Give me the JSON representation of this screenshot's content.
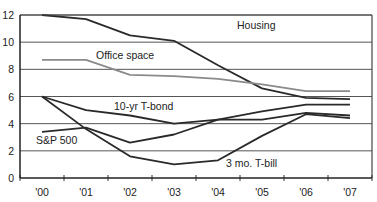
{
  "chart_data": {
    "type": "line",
    "title": "",
    "xlabel": "",
    "ylabel": "",
    "categories": [
      "'00",
      "'01",
      "'02",
      "'03",
      "'04",
      "'05",
      "'06",
      "'07"
    ],
    "ylim": [
      0,
      12
    ],
    "yticks": [
      0,
      2,
      4,
      6,
      8,
      10,
      12
    ],
    "grid": true,
    "legend": "inline labels",
    "series": [
      {
        "name": "Housing",
        "color": "#2a2a2a",
        "values": [
          12.0,
          11.7,
          10.5,
          10.1,
          8.3,
          6.6,
          5.9,
          5.8
        ]
      },
      {
        "name": "Office space",
        "color": "#8a8a8a",
        "values": [
          8.7,
          8.7,
          7.6,
          7.5,
          7.3,
          6.9,
          6.4,
          6.4
        ]
      },
      {
        "name": "10-yr T-bond",
        "color": "#2a2a2a",
        "values": [
          6.0,
          5.0,
          4.6,
          4.0,
          4.3,
          4.3,
          4.8,
          4.6
        ]
      },
      {
        "name": "S&P 500",
        "color": "#2a2a2a",
        "values": [
          3.4,
          3.7,
          2.6,
          3.2,
          4.3,
          4.9,
          5.4,
          5.4
        ]
      },
      {
        "name": "3 mo. T-bill",
        "color": "#2a2a2a",
        "values": [
          6.0,
          3.6,
          1.6,
          1.0,
          1.3,
          3.1,
          4.7,
          4.4
        ]
      }
    ],
    "labels": [
      {
        "text": "Housing",
        "x": 237,
        "y": 29
      },
      {
        "text": "Office space",
        "x": 96,
        "y": 59
      },
      {
        "text": "10-yr T-bond",
        "x": 114,
        "y": 110
      },
      {
        "text": "S&P 500",
        "x": 36,
        "y": 144
      },
      {
        "text": "3 mo. T-bill",
        "x": 226,
        "y": 167
      }
    ]
  }
}
